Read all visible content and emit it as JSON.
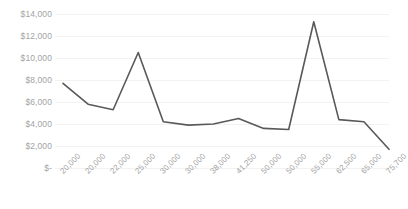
{
  "chart_data": {
    "type": "line",
    "title": "",
    "subtitle": "",
    "xlabel": "",
    "ylabel": "",
    "categories": [
      "20,000",
      "20,000",
      "22,000",
      "25,000",
      "30,000",
      "30,000",
      "38,000",
      "41,250",
      "50,000",
      "50,000",
      "55,000",
      "62,500",
      "65,000",
      "75,700"
    ],
    "values": [
      7700,
      5800,
      5300,
      10500,
      4200,
      3900,
      4000,
      4500,
      3600,
      3500,
      13300,
      4400,
      4200,
      1700
    ],
    "series": [
      {
        "name": "Series 1",
        "values": [
          7700,
          5800,
          5300,
          10500,
          4200,
          3900,
          4000,
          4500,
          3600,
          3500,
          13300,
          4400,
          4200,
          1700
        ]
      }
    ],
    "ylim": [
      0,
      14000
    ],
    "ytick_values": [
      0,
      2000,
      4000,
      6000,
      8000,
      10000,
      12000,
      14000
    ],
    "ytick_labels": [
      "$-",
      "$2,000",
      "$4,000",
      "$6,000",
      "$8,000",
      "$10,000",
      "$12,000",
      "$14,000"
    ],
    "grid": true,
    "grid_axis": "y",
    "legend": false,
    "legend_position": "none",
    "line_color": "#595959",
    "grid_color": "#f2f2f2",
    "label_color": "#a3a3a3",
    "background": "#ffffff",
    "xtick_rotation": -45,
    "markers": false,
    "line_width": 1.6
  }
}
